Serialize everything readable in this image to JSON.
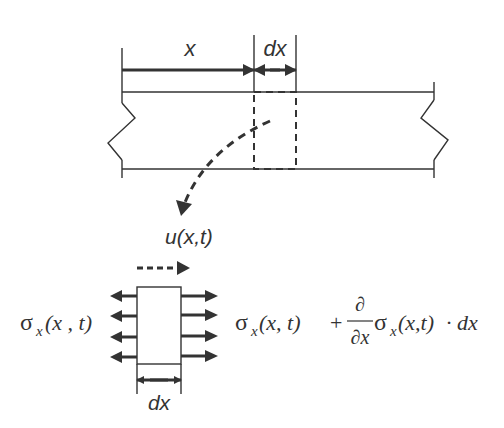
{
  "diagram": {
    "colors": {
      "stroke": "#333333",
      "background": "#ffffff"
    },
    "beam": {
      "dimension_x_label": "x",
      "dimension_dx_label": "dx",
      "element_style": "dashed"
    },
    "element": {
      "displacement_label": "u(x,t)",
      "left_stress_sigma": "σ",
      "left_stress_sub": "x",
      "left_stress_args": "(x , t)",
      "right_stress_sigma": "σ",
      "right_stress_sub": "x",
      "right_stress_args": "(x, t)",
      "plus": "+",
      "partial_num": "∂",
      "partial_den": "∂x",
      "deriv_sigma": "σ",
      "deriv_sub": "x",
      "deriv_args": "(x,t)",
      "times_dx": "· dx",
      "width_label": "dx",
      "arrows_per_side": 4
    }
  }
}
